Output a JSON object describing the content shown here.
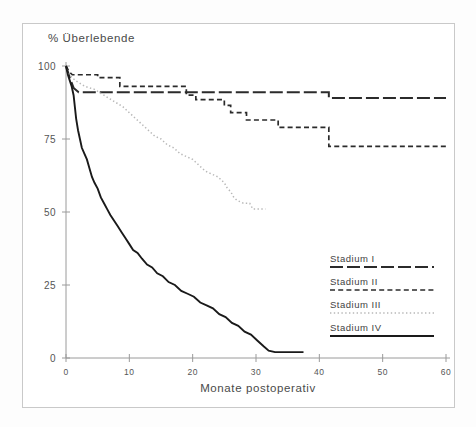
{
  "figure": {
    "background_color": "#fdfdfd",
    "frame_color": "#c9c9c9"
  },
  "chart_data": {
    "type": "line",
    "title": "",
    "subtitle": "",
    "xlabel": "Monate postoperativ",
    "ylabel": "% Überlebende",
    "xlim": [
      0,
      60
    ],
    "ylim": [
      0,
      100
    ],
    "xticks": [
      0,
      10,
      20,
      30,
      40,
      50,
      60
    ],
    "xticklabels": [
      "0",
      "10",
      "20",
      "30",
      "40",
      "50",
      "60"
    ],
    "yticks": [
      0,
      25,
      50,
      75,
      100
    ],
    "yticklabels": [
      "0",
      "25",
      "50",
      "75",
      "100"
    ],
    "grid": false,
    "legend_position": "center-right",
    "curve_kind": "kaplan-meier-step",
    "series": [
      {
        "name": "Stadium I",
        "label": "Stadium I",
        "linestyle": "long-dash",
        "color": "#2b2b2b",
        "dasharray": "13,4",
        "width": 2.0,
        "points": [
          [
            0,
            100
          ],
          [
            0.6,
            96
          ],
          [
            1.2,
            92.5
          ],
          [
            2.0,
            91
          ],
          [
            3.0,
            91
          ],
          [
            41.5,
            91
          ],
          [
            41.5,
            89
          ],
          [
            60,
            89
          ]
        ]
      },
      {
        "name": "Stadium II",
        "label": "Stadium II",
        "linestyle": "dashed",
        "color": "#2b2b2b",
        "dasharray": "5,3.2",
        "width": 1.7,
        "points": [
          [
            0,
            100
          ],
          [
            0.5,
            98
          ],
          [
            1.0,
            97
          ],
          [
            2.5,
            97
          ],
          [
            5.0,
            97
          ],
          [
            5.0,
            96
          ],
          [
            8.5,
            96
          ],
          [
            8.5,
            93
          ],
          [
            11.0,
            93
          ],
          [
            19.0,
            93
          ],
          [
            19.0,
            90
          ],
          [
            20.5,
            90
          ],
          [
            20.5,
            88.5
          ],
          [
            25.0,
            88.5
          ],
          [
            25.0,
            86.5
          ],
          [
            26.0,
            86.5
          ],
          [
            26.0,
            84
          ],
          [
            28.5,
            84
          ],
          [
            28.5,
            81.5
          ],
          [
            33.5,
            81.5
          ],
          [
            33.5,
            79
          ],
          [
            41.5,
            79
          ],
          [
            41.5,
            72.5
          ],
          [
            60,
            72.5
          ]
        ]
      },
      {
        "name": "Stadium III",
        "label": "Stadium III",
        "linestyle": "dotted",
        "color": "#b8b8b8",
        "dasharray": "1.4,2.4",
        "width": 1.5,
        "points": [
          [
            0,
            100
          ],
          [
            0.5,
            97
          ],
          [
            1.5,
            95
          ],
          [
            3.0,
            93
          ],
          [
            4.5,
            92
          ],
          [
            6.0,
            90
          ],
          [
            7.5,
            88
          ],
          [
            9.0,
            86
          ],
          [
            10.0,
            84
          ],
          [
            11.0,
            82
          ],
          [
            12.0,
            80
          ],
          [
            13.0,
            78
          ],
          [
            14.0,
            76
          ],
          [
            15.0,
            75
          ],
          [
            16.0,
            73
          ],
          [
            17.0,
            72
          ],
          [
            18.0,
            70
          ],
          [
            19.0,
            69
          ],
          [
            20.0,
            68
          ],
          [
            21.0,
            66
          ],
          [
            22.0,
            64
          ],
          [
            23.0,
            63
          ],
          [
            24.0,
            62
          ],
          [
            25.0,
            60
          ],
          [
            25.5,
            58
          ],
          [
            26.0,
            57
          ],
          [
            26.5,
            55
          ],
          [
            27.0,
            54
          ],
          [
            28.0,
            53
          ],
          [
            29.0,
            53
          ],
          [
            29.5,
            51
          ],
          [
            31.5,
            51
          ]
        ]
      },
      {
        "name": "Stadium IV",
        "label": "Stadium IV",
        "linestyle": "solid",
        "color": "#1a1a1a",
        "dasharray": "",
        "width": 1.9,
        "points": [
          [
            0,
            100
          ],
          [
            0.3,
            97
          ],
          [
            0.6,
            95
          ],
          [
            0.9,
            93
          ],
          [
            1.2,
            90
          ],
          [
            1.4,
            86
          ],
          [
            1.6,
            82
          ],
          [
            1.9,
            78
          ],
          [
            2.2,
            75
          ],
          [
            2.5,
            72
          ],
          [
            2.9,
            70
          ],
          [
            3.3,
            68
          ],
          [
            3.7,
            65
          ],
          [
            4.1,
            62
          ],
          [
            4.5,
            60
          ],
          [
            5.0,
            58
          ],
          [
            5.5,
            55
          ],
          [
            6.0,
            53
          ],
          [
            6.5,
            51
          ],
          [
            7.0,
            49
          ],
          [
            7.6,
            47
          ],
          [
            8.2,
            45
          ],
          [
            8.8,
            43
          ],
          [
            9.4,
            41
          ],
          [
            10.0,
            39
          ],
          [
            10.6,
            37
          ],
          [
            11.3,
            36
          ],
          [
            12.0,
            34
          ],
          [
            12.8,
            32
          ],
          [
            13.6,
            31
          ],
          [
            14.4,
            29
          ],
          [
            15.3,
            28
          ],
          [
            16.2,
            26
          ],
          [
            17.2,
            25
          ],
          [
            18.2,
            23
          ],
          [
            19.2,
            22
          ],
          [
            20.2,
            21
          ],
          [
            21.2,
            19
          ],
          [
            22.2,
            18
          ],
          [
            23.2,
            17
          ],
          [
            24.2,
            15
          ],
          [
            25.2,
            14
          ],
          [
            26.2,
            12
          ],
          [
            27.2,
            11
          ],
          [
            28.2,
            9
          ],
          [
            29.2,
            8
          ],
          [
            30.2,
            6
          ],
          [
            31.2,
            4
          ],
          [
            32.0,
            2.5
          ],
          [
            33.0,
            2
          ],
          [
            37.5,
            2
          ]
        ]
      }
    ]
  },
  "legend": {
    "items": [
      {
        "label": "Stadium I"
      },
      {
        "label": "Stadium II"
      },
      {
        "label": "Stadium III"
      },
      {
        "label": "Stadium IV"
      }
    ]
  }
}
